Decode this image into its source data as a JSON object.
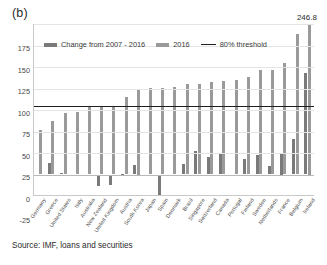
{
  "figure": {
    "panel_label": "(b)",
    "source_note": "Source: IMF, loans and securities"
  },
  "legend": {
    "items": [
      {
        "label": "Change from 2007 - 2016",
        "type": "bar",
        "color": "#7a7a7a"
      },
      {
        "label": "2016",
        "type": "bar",
        "color": "#9a9a9a"
      },
      {
        "label": "80% threshold",
        "type": "line",
        "color": "#1f1f1f"
      }
    ]
  },
  "annotations": [
    {
      "name": "ireland-value-label",
      "text": "246.8"
    }
  ],
  "chart_data": {
    "type": "bar",
    "title": "(b)",
    "subtitle": "",
    "xlabel": "",
    "ylabel": "",
    "ylim": [
      -25,
      175
    ],
    "yticks": [
      -25,
      0,
      25,
      50,
      75,
      100,
      125,
      150,
      175
    ],
    "ytick_labels": [
      "-25",
      "0",
      "25",
      "50",
      "75",
      "100",
      "125",
      "150",
      "175"
    ],
    "grid": true,
    "legend_position": "top-left-inside",
    "threshold": {
      "label": "80% threshold",
      "value": 80,
      "color": "#1f1f1f"
    },
    "categories": [
      "Germany",
      "Greece",
      "United States",
      "Italy",
      "Australia",
      "New Zealand",
      "United Kingdom",
      "Austria",
      "South Korea",
      "Japan",
      "Spain",
      "Denmark",
      "Brazil",
      "Singapore",
      "Switzerland",
      "Canada",
      "Portugal",
      "Finland",
      "Sweden",
      "Netherlands",
      "France",
      "Belgium",
      "Ireland"
    ],
    "series": [
      {
        "name": "Change from 2007 - 2016",
        "color": "#7a7a7a",
        "values": [
          -2,
          13,
          1.5,
          -1,
          -1.5,
          -13,
          -12,
          1,
          11,
          -2,
          -24,
          -2,
          12,
          27,
          20,
          24,
          -1.5,
          18,
          23,
          10,
          25,
          41,
          118
        ]
      },
      {
        "name": "2016",
        "color": "#9a9a9a",
        "values": [
          52,
          62,
          71,
          73,
          79,
          79,
          79,
          90,
          100,
          101,
          101,
          102,
          105,
          105,
          108,
          109,
          110,
          113,
          121,
          121,
          130,
          163,
          246.8
        ]
      }
    ],
    "value_labels": [
      {
        "category": "Ireland",
        "series": "2016",
        "text": "246.8",
        "exceeds_axis": true
      }
    ]
  }
}
